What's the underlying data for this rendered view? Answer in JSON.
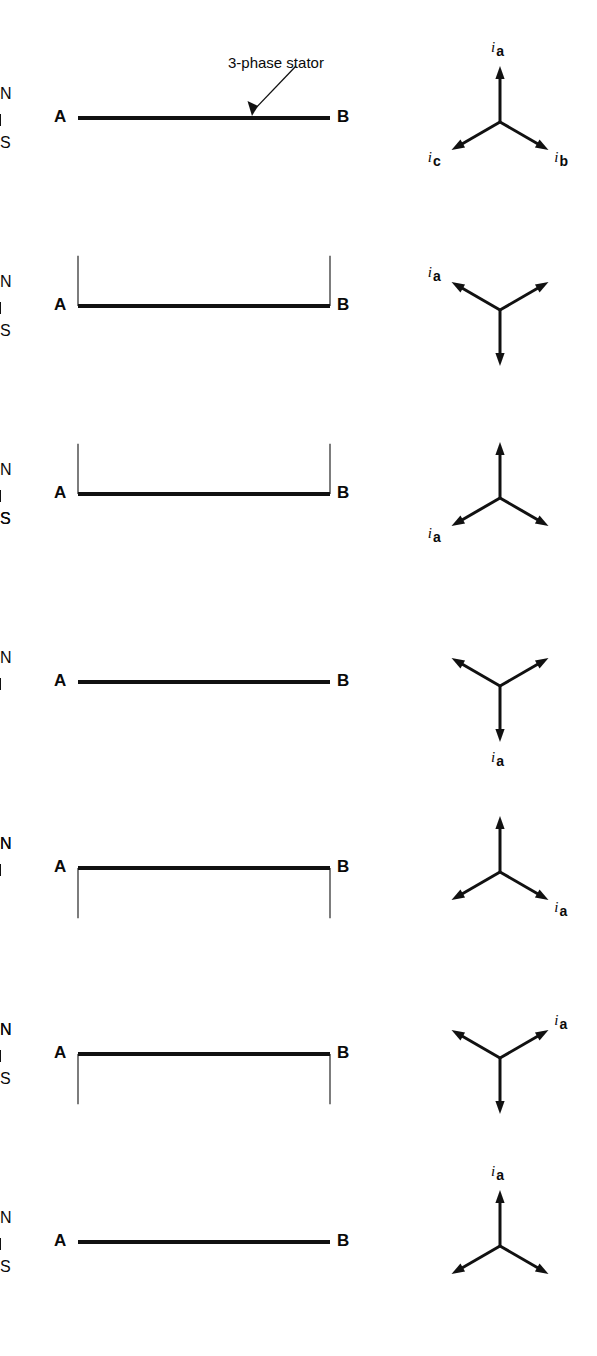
{
  "figure": {
    "axis_start_label": "A",
    "axis_end_label": "B",
    "north_label": "N",
    "south_label": "S",
    "annotation": "3-phase stator",
    "stroke_color": "#111111",
    "fill_stipple_color": "#1a1a1a",
    "background": "#ffffff",
    "baseline_x_start": 78,
    "baseline_x_end": 330,
    "cycle_degrees": 360,
    "tick_count": 5,
    "row_count": 7
  },
  "phasor_legend": {
    "a_symbol": "i",
    "a_subscript": "a",
    "b_symbol": "i",
    "b_subscript": "b",
    "c_symbol": "i",
    "c_subscript": "c"
  },
  "chart_data": {
    "type": "line",
    "xlabel": "Stator periphery (A to B = 360 electrical degrees)",
    "ylabel": "Flux density",
    "x": [
      0,
      30,
      60,
      90,
      120,
      150,
      180,
      210,
      240,
      270,
      300,
      330,
      360
    ],
    "xlim": [
      0,
      360
    ],
    "ylim": [
      -1,
      1
    ],
    "grid": false,
    "legend": "none",
    "tick_positions_deg": [
      60,
      120,
      180,
      240,
      300
    ],
    "series": [
      {
        "name": "Row 1 — phase angle 0 deg",
        "phase_deg": 0,
        "amplitude": 1,
        "values": [
          0,
          0.5,
          0.866,
          1,
          0.866,
          0.5,
          0,
          -0.5,
          -0.866,
          -1,
          -0.866,
          -0.5,
          0
        ],
        "north_label_x_deg": 90,
        "south_label_x_deg": 250,
        "north_shown": true,
        "south_shown": true,
        "phasors": [
          {
            "name": "i_a",
            "angle_deg": 90,
            "labeled": true
          },
          {
            "name": "i_b",
            "angle_deg": -30,
            "labeled": true
          },
          {
            "name": "i_c",
            "angle_deg": 210,
            "labeled": true
          }
        ],
        "annotation_shown": true
      },
      {
        "name": "Row 2 — phase angle 60 deg",
        "phase_deg": 60,
        "amplitude": 1,
        "values": [
          -0.866,
          -0.5,
          0,
          0.5,
          0.866,
          1,
          0.866,
          0.5,
          0,
          -0.5,
          -0.866,
          -1,
          -0.866
        ],
        "north_label_x_deg": 150,
        "south_label_x_deg": 300,
        "north_shown": true,
        "south_shown": true,
        "phasors": [
          {
            "name": "i_a",
            "angle_deg": 150,
            "labeled": true
          },
          {
            "name": "i_b",
            "angle_deg": 30,
            "labeled": false
          },
          {
            "name": "i_c",
            "angle_deg": 270,
            "labeled": false
          }
        ],
        "annotation_shown": false
      },
      {
        "name": "Row 3 — phase angle 120 deg",
        "phase_deg": 120,
        "amplitude": 1,
        "values": [
          -0.866,
          -1,
          -0.866,
          -0.5,
          0,
          0.5,
          0.866,
          1,
          0.866,
          0.5,
          0,
          -0.5,
          -0.866
        ],
        "north_label_x_deg": 210,
        "south_label_x_deg": 40,
        "south_label_x2_deg": 330,
        "north_shown": true,
        "south_shown": true,
        "phasors": [
          {
            "name": "i_a",
            "angle_deg": 210,
            "labeled": true
          },
          {
            "name": "i_b",
            "angle_deg": 90,
            "labeled": false
          },
          {
            "name": "i_c",
            "angle_deg": 330,
            "labeled": false
          }
        ],
        "annotation_shown": false
      },
      {
        "name": "Row 4 — phase angle 180 deg",
        "phase_deg": 180,
        "amplitude": 1,
        "values": [
          0,
          -0.5,
          -0.866,
          -1,
          -0.866,
          -0.5,
          0,
          0.5,
          0.866,
          1,
          0.866,
          0.5,
          0
        ],
        "north_label_x_deg": 270,
        "south_label_x_deg": null,
        "north_shown": true,
        "south_shown": false,
        "phasors": [
          {
            "name": "i_a",
            "angle_deg": 270,
            "labeled": true
          },
          {
            "name": "i_b",
            "angle_deg": 150,
            "labeled": false
          },
          {
            "name": "i_c",
            "angle_deg": 30,
            "labeled": false
          }
        ],
        "annotation_shown": false
      },
      {
        "name": "Row 5 — phase angle 240 deg",
        "phase_deg": 240,
        "amplitude": 1,
        "values": [
          0.866,
          0.5,
          0,
          -0.5,
          -0.866,
          -1,
          -0.866,
          -0.5,
          0,
          0.5,
          0.866,
          1,
          0.866
        ],
        "north_label_x_deg": 18,
        "north_label_x2_deg": 320,
        "south_label_x_deg": null,
        "north_shown": true,
        "south_shown": false,
        "phasors": [
          {
            "name": "i_a",
            "angle_deg": 330,
            "labeled": true
          },
          {
            "name": "i_b",
            "angle_deg": 210,
            "labeled": false
          },
          {
            "name": "i_c",
            "angle_deg": 90,
            "labeled": false
          }
        ],
        "annotation_shown": false
      },
      {
        "name": "Row 6 — phase angle 300 deg",
        "phase_deg": 300,
        "amplitude": 1,
        "values": [
          0.866,
          1,
          0.866,
          0.5,
          0,
          -0.5,
          -0.866,
          -1,
          -0.866,
          -0.5,
          0,
          0.5,
          0.866
        ],
        "north_label_x_deg": 30,
        "north_label_x2_deg": 340,
        "south_label_x_deg": 195,
        "north_shown": true,
        "south_shown": true,
        "phasors": [
          {
            "name": "i_a",
            "angle_deg": 30,
            "labeled": true
          },
          {
            "name": "i_b",
            "angle_deg": 270,
            "labeled": false
          },
          {
            "name": "i_c",
            "angle_deg": 150,
            "labeled": false
          }
        ],
        "annotation_shown": false
      },
      {
        "name": "Row 7 — phase angle 360 deg",
        "phase_deg": 360,
        "amplitude": 1,
        "values": [
          0,
          0.5,
          0.866,
          1,
          0.866,
          0.5,
          0,
          -0.5,
          -0.866,
          -1,
          -0.866,
          -0.5,
          0
        ],
        "north_label_x_deg": 90,
        "south_label_x_deg": 250,
        "north_shown": true,
        "south_shown": true,
        "phasors": [
          {
            "name": "i_a",
            "angle_deg": 90,
            "labeled": true
          },
          {
            "name": "i_b",
            "angle_deg": -30,
            "labeled": false
          },
          {
            "name": "i_c",
            "angle_deg": 210,
            "labeled": false
          }
        ],
        "annotation_shown": false
      }
    ]
  }
}
